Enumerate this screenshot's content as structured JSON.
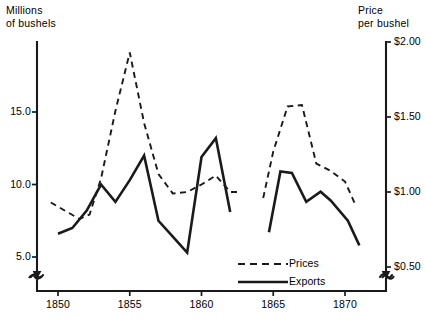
{
  "chart_data": {
    "type": "line",
    "title": "",
    "xlabel": "",
    "ylabel": "Millions of bushels",
    "y2label": "Price per bushel",
    "grid": false,
    "legend_position": "bottom-right",
    "xlim": [
      1848.6,
      1871.9
    ],
    "ylim": [
      3.9,
      19.9
    ],
    "y2lim": [
      0.36,
      2.12
    ],
    "x_ticks": [
      1850,
      1855,
      1860,
      1865,
      1870
    ],
    "x_tick_labels": [
      "1850",
      "1855",
      "1860",
      "1865",
      "1870"
    ],
    "y_ticks": [
      5.0,
      10.0,
      15.0
    ],
    "y_tick_labels": [
      "5.0",
      "10.0",
      "15.0"
    ],
    "y2_ticks": [
      0.5,
      1.0,
      1.5,
      2.0
    ],
    "y2_tick_labels": [
      "$0.50",
      "$1.00",
      "$1.50",
      "$2.00"
    ],
    "axis_break_note": "both value axes are broken below their lowest tick",
    "series": [
      {
        "name": "Prices",
        "axis": "right",
        "style": "dashed",
        "unit": "dollars per bushel",
        "segments": [
          {
            "x": [
              1849.5,
              1850.4,
              1851.5,
              1852.2,
              1853.0,
              1854.0,
              1855.0,
              1856.0,
              1857.0,
              1858.0,
              1859.0,
              1860.0,
              1861.0,
              1862.0,
              1862.6
            ],
            "y": [
              0.93,
              0.88,
              0.82,
              0.85,
              1.09,
              1.54,
              1.93,
              1.46,
              1.12,
              0.99,
              1.0,
              1.05,
              1.11,
              1.0,
              1.0
            ]
          },
          {
            "x": [
              1864.3,
              1865.0,
              1866.0,
              1867.0,
              1868.0,
              1869.0,
              1870.0,
              1870.7
            ],
            "y": [
              0.96,
              1.27,
              1.57,
              1.58,
              1.19,
              1.14,
              1.07,
              0.92
            ]
          }
        ]
      },
      {
        "name": "Exports",
        "axis": "left",
        "style": "solid",
        "unit": "millions of bushels",
        "segments": [
          {
            "x": [
              1850.0,
              1851.0,
              1852.0,
              1853.0,
              1854.0,
              1855.0,
              1856.0,
              1857.0,
              1858.0,
              1859.0,
              1860.0,
              1861.0,
              1862.0
            ],
            "y": [
              6.6,
              7.0,
              8.2,
              10.0,
              8.8,
              10.3,
              12.0,
              7.5,
              6.4,
              5.3,
              11.9,
              13.2,
              8.1
            ]
          },
          {
            "x": [
              1864.7,
              1865.5,
              1866.3,
              1867.3,
              1868.3,
              1869.0,
              1870.2,
              1871.0
            ],
            "y": [
              6.7,
              10.9,
              10.8,
              8.8,
              9.5,
              8.9,
              7.5,
              5.8
            ]
          }
        ]
      }
    ]
  },
  "labels": {
    "left_axis_title": "Millions\nof bushels",
    "right_axis_title": "Price\nper bushel"
  },
  "legend": {
    "items": [
      {
        "label": "Prices",
        "style": "dashed"
      },
      {
        "label": "Exports",
        "style": "solid"
      }
    ]
  }
}
